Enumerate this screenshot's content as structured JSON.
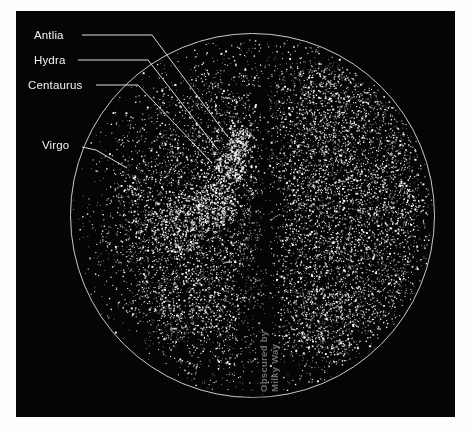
{
  "figure": {
    "type": "sky-map"
  },
  "plate": {
    "background_color": "#050505",
    "border_color": "#ffffff"
  },
  "circle": {
    "center_x": 252,
    "center_y": 215,
    "radius": 182,
    "outline_color": "#c9c9c4"
  },
  "labels": [
    {
      "id": "antlia",
      "text": "Antlia",
      "x": 34,
      "y": 29,
      "leader_start_x": 82,
      "leader_start_y": 35,
      "leader_mid_x": 152,
      "leader_mid_y": 35,
      "leader_end_x": 228,
      "leader_end_y": 137
    },
    {
      "id": "hydra",
      "text": "Hydra",
      "x": 34,
      "y": 54,
      "leader_start_x": 78,
      "leader_start_y": 60,
      "leader_mid_x": 148,
      "leader_mid_y": 60,
      "leader_end_x": 218,
      "leader_end_y": 150
    },
    {
      "id": "centaurus",
      "text": "Centaurus",
      "x": 28,
      "y": 79,
      "leader_start_x": 96,
      "leader_start_y": 85,
      "leader_mid_x": 138,
      "leader_mid_y": 85,
      "leader_end_x": 212,
      "leader_end_y": 163
    },
    {
      "id": "virgo",
      "text": "Virgo",
      "x": 42,
      "y": 139,
      "leader_start_x": 82,
      "leader_start_y": 147,
      "leader_mid_x": 96,
      "leader_mid_y": 150,
      "leader_end_x": 127,
      "leader_end_y": 168
    }
  ],
  "milky_way_caption": {
    "line1": "Obscured by",
    "line2": "Milky Way",
    "x": 258,
    "y": 392,
    "color": "#6f6f6c"
  },
  "chart_data": {
    "type": "scatter",
    "title": "",
    "xlabel": "",
    "ylabel": "",
    "projection": "circular all-sky",
    "point_color": "#ffffff",
    "background_color": "#050505",
    "grid": false,
    "legend": null,
    "annotations": [
      "Antlia",
      "Hydra",
      "Centaurus",
      "Virgo",
      "Obscured by Milky Way"
    ],
    "total_points": 14000,
    "density_regions": [
      {
        "name": "virgo-supercluster",
        "cx": 0.3,
        "cy": 0.52,
        "radius": 0.15,
        "weight": 3.2
      },
      {
        "name": "centaurus-cluster",
        "cx": 0.4,
        "cy": 0.47,
        "radius": 0.11,
        "weight": 2.6
      },
      {
        "name": "hydra-cluster",
        "cx": 0.44,
        "cy": 0.37,
        "radius": 0.08,
        "weight": 2.2
      },
      {
        "name": "antlia-cluster",
        "cx": 0.47,
        "cy": 0.3,
        "radius": 0.07,
        "weight": 1.9
      },
      {
        "name": "coma-right-field",
        "cx": 0.78,
        "cy": 0.45,
        "radius": 0.3,
        "weight": 2.4
      },
      {
        "name": "upper-right-wall",
        "cx": 0.72,
        "cy": 0.2,
        "radius": 0.18,
        "weight": 1.8
      },
      {
        "name": "lower-left-filament",
        "cx": 0.33,
        "cy": 0.74,
        "radius": 0.16,
        "weight": 1.3
      },
      {
        "name": "lower-right-filament",
        "cx": 0.7,
        "cy": 0.78,
        "radius": 0.18,
        "weight": 1.5
      }
    ],
    "zone_of_avoidance": {
      "label": "Obscured by Milky Way",
      "center_x_fraction": 0.545,
      "top_width_fraction": 0.055,
      "bottom_width_fraction": 0.115,
      "suppression": 0.95
    }
  }
}
